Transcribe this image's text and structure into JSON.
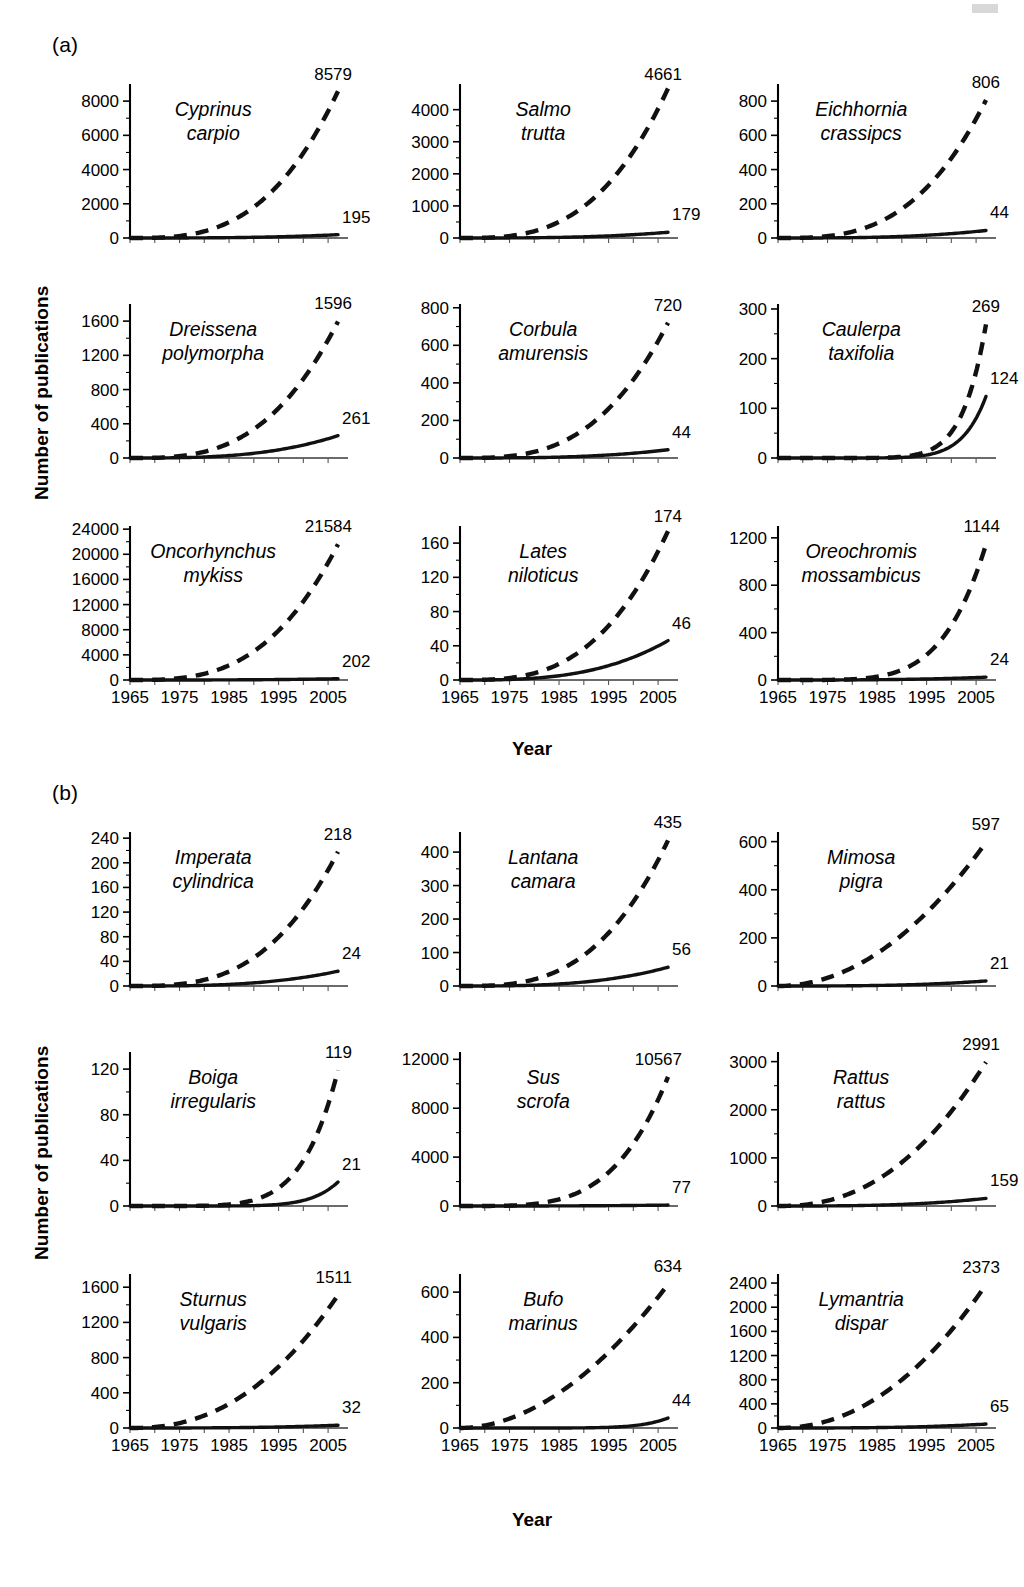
{
  "figure": {
    "axis_label_y": "Number of publications",
    "axis_label_x": "Year",
    "panel_labels": {
      "a": "(a)",
      "b": "(b)"
    },
    "x_ticks": [
      "1965",
      "1975",
      "1985",
      "1995",
      "2005"
    ],
    "x_range": [
      1965,
      2007
    ],
    "series_legend": {
      "dashed": "Total publications (all topics)",
      "solid": "Invasion-related publications"
    }
  },
  "chart_data": [
    {
      "type": "line",
      "group": "(a)",
      "title": "Cyprinus carpio",
      "species_lines": [
        "Cyprinus",
        "carpio"
      ],
      "xlabel": "Year",
      "ylabel": "Number of publications",
      "xlim": [
        1965,
        2007
      ],
      "ylim": [
        0,
        9000
      ],
      "ytick_labels": [
        "0",
        "2000",
        "4000",
        "6000",
        "8000"
      ],
      "ytick_values": [
        0,
        2000,
        4000,
        6000,
        8000
      ],
      "grid": false,
      "series": [
        {
          "name": "dashed",
          "style": "dashed",
          "end_label": "8579",
          "end_value": 8579
        },
        {
          "name": "solid",
          "style": "solid",
          "end_label": "195",
          "end_value": 195
        }
      ]
    },
    {
      "type": "line",
      "group": "(a)",
      "title": "Salmo trutta",
      "species_lines": [
        "Salmo",
        "trutta"
      ],
      "xlim": [
        1965,
        2007
      ],
      "ylim": [
        0,
        4800
      ],
      "ytick_labels": [
        "0",
        "1000",
        "2000",
        "3000",
        "4000"
      ],
      "ytick_values": [
        0,
        1000,
        2000,
        3000,
        4000
      ],
      "grid": false,
      "series": [
        {
          "name": "dashed",
          "style": "dashed",
          "end_label": "4661",
          "end_value": 4661
        },
        {
          "name": "solid",
          "style": "solid",
          "end_label": "179",
          "end_value": 179
        }
      ]
    },
    {
      "type": "line",
      "group": "(a)",
      "title": "Eichhornia crassipcs",
      "species_lines": [
        "Eichhornia",
        "crassipcs"
      ],
      "xlim": [
        1965,
        2007
      ],
      "ylim": [
        0,
        900
      ],
      "ytick_labels": [
        "0",
        "200",
        "400",
        "600",
        "800"
      ],
      "ytick_values": [
        0,
        200,
        400,
        600,
        800
      ],
      "grid": false,
      "series": [
        {
          "name": "dashed",
          "style": "dashed",
          "end_label": "806",
          "end_value": 806
        },
        {
          "name": "solid",
          "style": "solid",
          "end_label": "44",
          "end_value": 44
        }
      ]
    },
    {
      "type": "line",
      "group": "(a)",
      "title": "Dreissena polymorpha",
      "species_lines": [
        "Dreissena",
        "polymorpha"
      ],
      "xlim": [
        1965,
        2007
      ],
      "ylim": [
        0,
        1800
      ],
      "ytick_labels": [
        "0",
        "400",
        "800",
        "1200",
        "1600"
      ],
      "ytick_values": [
        0,
        400,
        800,
        1200,
        1600
      ],
      "grid": false,
      "series": [
        {
          "name": "dashed",
          "style": "dashed",
          "end_label": "1596",
          "end_value": 1596
        },
        {
          "name": "solid",
          "style": "solid",
          "end_label": "261",
          "end_value": 261
        }
      ]
    },
    {
      "type": "line",
      "group": "(a)",
      "title": "Corbula amurensis",
      "species_lines": [
        "Corbula",
        "amurensis"
      ],
      "xlim": [
        1965,
        2007
      ],
      "ylim": [
        0,
        820
      ],
      "ytick_labels": [
        "0",
        "200",
        "400",
        "600",
        "800"
      ],
      "ytick_values": [
        0,
        200,
        400,
        600,
        800
      ],
      "grid": false,
      "series": [
        {
          "name": "dashed",
          "style": "dashed",
          "end_label": "720",
          "end_value": 720
        },
        {
          "name": "solid",
          "style": "solid",
          "end_label": "44",
          "end_value": 44
        }
      ]
    },
    {
      "type": "line",
      "group": "(a)",
      "title": "Caulerpa taxifolia",
      "species_lines": [
        "Caulerpa",
        "taxifolia"
      ],
      "xlim": [
        1965,
        2007
      ],
      "ylim": [
        0,
        310
      ],
      "ytick_labels": [
        "0",
        "100",
        "200",
        "300"
      ],
      "ytick_values": [
        0,
        100,
        200,
        300
      ],
      "grid": false,
      "series": [
        {
          "name": "dashed",
          "style": "dashed",
          "end_label": "269",
          "end_value": 269,
          "exponent": 9
        },
        {
          "name": "solid",
          "style": "solid",
          "end_label": "124",
          "end_value": 124,
          "exponent": 9
        }
      ]
    },
    {
      "type": "line",
      "group": "(a)",
      "title": "Oncorhynchus mykiss",
      "species_lines": [
        "Oncorhynchus",
        "mykiss"
      ],
      "xlim": [
        1965,
        2007
      ],
      "ylim": [
        0,
        24500
      ],
      "ytick_labels": [
        "0",
        "4000",
        "8000",
        "12000",
        "16000",
        "20000",
        "24000"
      ],
      "ytick_values": [
        0,
        4000,
        8000,
        12000,
        16000,
        20000,
        24000
      ],
      "grid": false,
      "series": [
        {
          "name": "dashed",
          "style": "dashed",
          "end_label": "21584",
          "end_value": 21584
        },
        {
          "name": "solid",
          "style": "solid",
          "end_label": "202",
          "end_value": 202
        }
      ]
    },
    {
      "type": "line",
      "group": "(a)",
      "title": "Lates niloticus",
      "species_lines": [
        "Lates",
        "niloticus"
      ],
      "xlim": [
        1965,
        2007
      ],
      "ylim": [
        0,
        180
      ],
      "ytick_labels": [
        "0",
        "40",
        "80",
        "120",
        "160"
      ],
      "ytick_values": [
        0,
        40,
        80,
        120,
        160
      ],
      "grid": false,
      "series": [
        {
          "name": "dashed",
          "style": "dashed",
          "end_label": "174",
          "end_value": 174
        },
        {
          "name": "solid",
          "style": "solid",
          "end_label": "46",
          "end_value": 46
        }
      ]
    },
    {
      "type": "line",
      "group": "(a)",
      "title": "Oreochromis mossambicus",
      "species_lines": [
        "Oreochromis",
        "mossambicus"
      ],
      "xlim": [
        1965,
        2007
      ],
      "ylim": [
        0,
        1300
      ],
      "ytick_labels": [
        "0",
        "400",
        "800",
        "1200"
      ],
      "ytick_values": [
        0,
        400,
        800,
        1200
      ],
      "grid": false,
      "series": [
        {
          "name": "dashed",
          "style": "dashed",
          "end_label": "1144",
          "end_value": 1144,
          "exponent": 5
        },
        {
          "name": "solid",
          "style": "solid",
          "end_label": "24",
          "end_value": 24
        }
      ]
    },
    {
      "type": "line",
      "group": "(b)",
      "title": "Imperata cylindrica",
      "species_lines": [
        "Imperata",
        "cylindrica"
      ],
      "xlim": [
        1965,
        2007
      ],
      "ylim": [
        0,
        250
      ],
      "ytick_labels": [
        "0",
        "40",
        "80",
        "120",
        "160",
        "200",
        "240"
      ],
      "ytick_values": [
        0,
        40,
        80,
        120,
        160,
        200,
        240
      ],
      "grid": false,
      "series": [
        {
          "name": "dashed",
          "style": "dashed",
          "end_label": "218",
          "end_value": 218
        },
        {
          "name": "solid",
          "style": "solid",
          "end_label": "24",
          "end_value": 24
        }
      ]
    },
    {
      "type": "line",
      "group": "(b)",
      "title": "Lantana camara",
      "species_lines": [
        "Lantana",
        "camara"
      ],
      "xlim": [
        1965,
        2007
      ],
      "ylim": [
        0,
        460
      ],
      "ytick_labels": [
        "0",
        "100",
        "200",
        "300",
        "400"
      ],
      "ytick_values": [
        0,
        100,
        200,
        300,
        400
      ],
      "grid": false,
      "series": [
        {
          "name": "dashed",
          "style": "dashed",
          "end_label": "435",
          "end_value": 435
        },
        {
          "name": "solid",
          "style": "solid",
          "end_label": "56",
          "end_value": 56
        }
      ]
    },
    {
      "type": "line",
      "group": "(b)",
      "title": "Mimosa pigra",
      "species_lines": [
        "Mimosa",
        "pigra"
      ],
      "xlim": [
        1965,
        2007
      ],
      "ylim": [
        0,
        640
      ],
      "ytick_labels": [
        "0",
        "200",
        "400",
        "600"
      ],
      "ytick_values": [
        0,
        200,
        400,
        600
      ],
      "grid": false,
      "series": [
        {
          "name": "dashed",
          "style": "dashed",
          "end_label": "597",
          "end_value": 597,
          "exponent": 2
        },
        {
          "name": "solid",
          "style": "solid",
          "end_label": "21",
          "end_value": 21
        }
      ]
    },
    {
      "type": "line",
      "group": "(b)",
      "title": "Boiga irregularis",
      "species_lines": [
        "Boiga",
        "irregularis"
      ],
      "xlim": [
        1965,
        2007
      ],
      "ylim": [
        0,
        135
      ],
      "ytick_labels": [
        "0",
        "40",
        "80",
        "120"
      ],
      "ytick_values": [
        0,
        40,
        80,
        120
      ],
      "grid": false,
      "series": [
        {
          "name": "dashed",
          "style": "dashed",
          "end_label": "119",
          "end_value": 119,
          "exponent": 6
        },
        {
          "name": "solid",
          "style": "solid",
          "end_label": "21",
          "end_value": 21,
          "exponent": 8
        }
      ]
    },
    {
      "type": "line",
      "group": "(b)",
      "title": "Sus scrofa",
      "species_lines": [
        "Sus",
        "scrofa"
      ],
      "xlim": [
        1965,
        2007
      ],
      "ylim": [
        0,
        12600
      ],
      "ytick_labels": [
        "0",
        "4000",
        "8000",
        "12000"
      ],
      "ytick_values": [
        0,
        4000,
        8000,
        12000
      ],
      "grid": false,
      "series": [
        {
          "name": "dashed",
          "style": "dashed",
          "end_label": "10567",
          "end_value": 10567,
          "exponent": 4
        },
        {
          "name": "solid",
          "style": "solid",
          "end_label": "77",
          "end_value": 77
        }
      ]
    },
    {
      "type": "line",
      "group": "(b)",
      "title": "Rattus rattus",
      "species_lines": [
        "Rattus",
        "rattus"
      ],
      "xlim": [
        1965,
        2007
      ],
      "ylim": [
        0,
        3200
      ],
      "ytick_labels": [
        "0",
        "1000",
        "2000",
        "3000"
      ],
      "ytick_values": [
        0,
        1000,
        2000,
        3000
      ],
      "grid": false,
      "series": [
        {
          "name": "dashed",
          "style": "dashed",
          "end_label": "2991",
          "end_value": 2991,
          "exponent": 2.3
        },
        {
          "name": "solid",
          "style": "solid",
          "end_label": "159",
          "end_value": 159
        }
      ]
    },
    {
      "type": "line",
      "group": "(b)",
      "title": "Sturnus vulgaris",
      "species_lines": [
        "Sturnus",
        "vulgaris"
      ],
      "xlim": [
        1965,
        2007
      ],
      "ylim": [
        0,
        1750
      ],
      "ytick_labels": [
        "0",
        "400",
        "800",
        "1200",
        "1600"
      ],
      "ytick_values": [
        0,
        400,
        800,
        1200,
        1600
      ],
      "grid": false,
      "series": [
        {
          "name": "dashed",
          "style": "dashed",
          "end_label": "1511",
          "end_value": 1511,
          "exponent": 2.3
        },
        {
          "name": "solid",
          "style": "solid",
          "end_label": "32",
          "end_value": 32
        }
      ]
    },
    {
      "type": "line",
      "group": "(b)",
      "title": "Bufo marinus",
      "species_lines": [
        "Bufo",
        "marinus"
      ],
      "xlim": [
        1965,
        2007
      ],
      "ylim": [
        0,
        680
      ],
      "ytick_labels": [
        "0",
        "200",
        "400",
        "600"
      ],
      "ytick_values": [
        0,
        200,
        400,
        600
      ],
      "grid": false,
      "series": [
        {
          "name": "dashed",
          "style": "dashed",
          "end_label": "634",
          "end_value": 634,
          "exponent": 1.9
        },
        {
          "name": "solid",
          "style": "solid",
          "end_label": "44",
          "end_value": 44,
          "exponent": 8
        }
      ]
    },
    {
      "type": "line",
      "group": "(b)",
      "title": "Lymantria dispar",
      "species_lines": [
        "Lymantria",
        "dispar"
      ],
      "xlim": [
        1965,
        2007
      ],
      "ylim": [
        0,
        2550
      ],
      "ytick_labels": [
        "0",
        "400",
        "800",
        "1200",
        "1600",
        "2000",
        "2400"
      ],
      "ytick_values": [
        0,
        400,
        800,
        1200,
        1600,
        2000,
        2400
      ],
      "grid": false,
      "series": [
        {
          "name": "dashed",
          "style": "dashed",
          "end_label": "2373",
          "end_value": 2373,
          "exponent": 2.1
        },
        {
          "name": "solid",
          "style": "solid",
          "end_label": "65",
          "end_value": 65
        }
      ]
    }
  ]
}
